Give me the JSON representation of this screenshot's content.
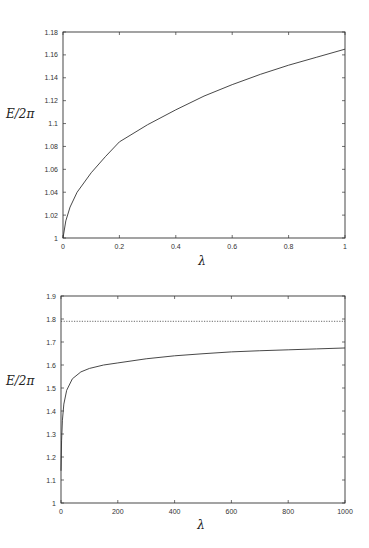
{
  "chart_data": [
    {
      "type": "line",
      "title": "",
      "xlabel": "λ",
      "ylabel": "E/2π",
      "xlim": [
        0,
        1
      ],
      "ylim": [
        1,
        1.18
      ],
      "grid": false,
      "x_ticks": [
        "0",
        "0.2",
        "0.4",
        "0.6",
        "0.8",
        "1"
      ],
      "y_ticks": [
        "1",
        "1.02",
        "1.04",
        "1.06",
        "1.08",
        "1.1",
        "1.12",
        "1.14",
        "1.16",
        "1.18"
      ],
      "series": [
        {
          "name": "E/2π",
          "style": "solid",
          "x": [
            0,
            0.01,
            0.025,
            0.05,
            0.1,
            0.15,
            0.2,
            0.3,
            0.4,
            0.5,
            0.6,
            0.7,
            0.8,
            0.9,
            1.0
          ],
          "y": [
            1.0,
            1.015,
            1.027,
            1.04,
            1.057,
            1.071,
            1.084,
            1.099,
            1.112,
            1.124,
            1.134,
            1.143,
            1.151,
            1.158,
            1.165
          ]
        }
      ]
    },
    {
      "type": "line",
      "title": "",
      "xlabel": "λ",
      "ylabel": "E/2π",
      "xlim": [
        0,
        1000
      ],
      "ylim": [
        1,
        1.9
      ],
      "grid": false,
      "x_ticks": [
        "0",
        "200",
        "400",
        "600",
        "800",
        "1000"
      ],
      "y_ticks": [
        "1",
        "1.1",
        "1.2",
        "1.3",
        "1.4",
        "1.5",
        "1.6",
        "1.7",
        "1.8",
        "1.9"
      ],
      "series": [
        {
          "name": "E/2π",
          "style": "solid",
          "x": [
            0,
            2,
            5,
            10,
            20,
            40,
            70,
            100,
            150,
            200,
            300,
            400,
            500,
            600,
            700,
            800,
            900,
            1000
          ],
          "y": [
            1.14,
            1.27,
            1.36,
            1.43,
            1.49,
            1.54,
            1.57,
            1.585,
            1.6,
            1.609,
            1.627,
            1.64,
            1.649,
            1.657,
            1.662,
            1.666,
            1.67,
            1.674
          ]
        },
        {
          "name": "asymptote",
          "style": "dotted",
          "x": [
            0,
            1000
          ],
          "y": [
            1.79,
            1.79
          ]
        }
      ]
    }
  ]
}
